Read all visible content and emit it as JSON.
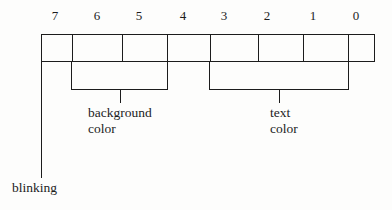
{
  "diagram": {
    "type": "bit-field-diagram",
    "line_color": "#1c1c1c",
    "background_color": "#fdfdfc",
    "bit_labels": [
      "7",
      "6",
      "5",
      "4",
      "3",
      "2",
      "1",
      "0"
    ],
    "cells": [
      {
        "bit": "7",
        "label": ""
      },
      {
        "bit": "6",
        "label": ""
      },
      {
        "bit": "5",
        "label": ""
      },
      {
        "bit": "4",
        "label": ""
      },
      {
        "bit": "3",
        "label": ""
      },
      {
        "bit": "2",
        "label": ""
      },
      {
        "bit": "1",
        "label": ""
      },
      {
        "bit": "0",
        "label": ""
      }
    ],
    "groups": [
      {
        "name": "background-color",
        "caption_line1": "background",
        "caption_line2": "color",
        "bits": [
          "6",
          "5",
          "4"
        ]
      },
      {
        "name": "text-color",
        "caption_line1": "text",
        "caption_line2": "color",
        "bits": [
          "3",
          "2",
          "1",
          "0"
        ]
      }
    ],
    "callouts": [
      {
        "name": "blinking",
        "caption": "blinking",
        "bit": "7"
      }
    ]
  }
}
